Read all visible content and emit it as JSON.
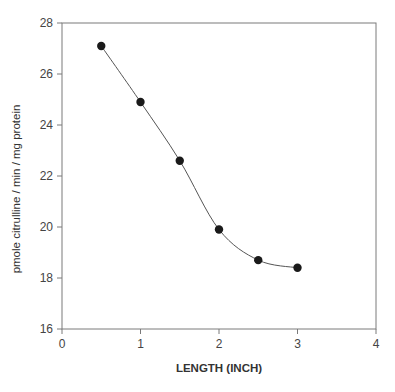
{
  "chart_data": {
    "type": "line",
    "title": "",
    "xlabel": "LENGTH (INCH)",
    "ylabel": "pmole citrulline / min / mg protein",
    "xlim": [
      0,
      4
    ],
    "ylim": [
      16,
      28
    ],
    "xticks": [
      0,
      1,
      2,
      3,
      4
    ],
    "yticks": [
      16,
      18,
      20,
      22,
      24,
      26,
      28
    ],
    "grid": false,
    "legend": null,
    "smooth": true,
    "series": [
      {
        "name": "citrulline",
        "marker": "filled-circle",
        "color": "#1a1a1a",
        "line_color": "#555555",
        "x": [
          0.5,
          1.0,
          1.5,
          2.0,
          2.5,
          3.0
        ],
        "y": [
          27.1,
          24.9,
          22.6,
          19.9,
          18.7,
          18.4
        ]
      }
    ]
  },
  "layout": {
    "plot_left": 62,
    "plot_right": 376,
    "plot_top": 23,
    "plot_bottom": 329
  }
}
